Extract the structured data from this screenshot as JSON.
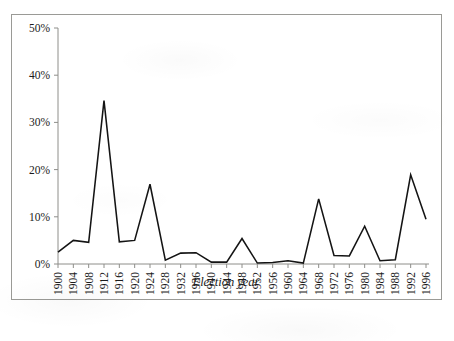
{
  "figure": {
    "axis_title_x": "Election year",
    "axis_title_y": "",
    "border_color": "#9a9a96",
    "line_color": "#141414",
    "background": "#ffffff"
  },
  "chart_data": {
    "type": "line",
    "title": "",
    "subtitle": "",
    "xlabel": "Election year",
    "ylabel": "",
    "grid": false,
    "legend": null,
    "xlim": [
      1900,
      1996
    ],
    "ylim": [
      0,
      50
    ],
    "ytick_labels": [
      "0%",
      "10%",
      "20%",
      "30%",
      "40%",
      "50%"
    ],
    "ytick_values": [
      0,
      10,
      20,
      30,
      40,
      50
    ],
    "categories": [
      "1900",
      "1904",
      "1908",
      "1912",
      "1916",
      "1920",
      "1924",
      "1928",
      "1932",
      "1936",
      "1940",
      "1944",
      "1948",
      "1952",
      "1956",
      "1960",
      "1964",
      "1968",
      "1972",
      "1976",
      "1980",
      "1984",
      "1988",
      "1992",
      "1996"
    ],
    "x": [
      1900,
      1904,
      1908,
      1912,
      1916,
      1920,
      1924,
      1928,
      1932,
      1936,
      1940,
      1944,
      1948,
      1952,
      1956,
      1960,
      1964,
      1968,
      1972,
      1976,
      1980,
      1984,
      1988,
      1992,
      1996
    ],
    "values": [
      2.5,
      5.0,
      4.6,
      34.6,
      4.7,
      5.0,
      16.9,
      0.8,
      2.3,
      2.4,
      0.4,
      0.4,
      5.4,
      0.2,
      0.3,
      0.7,
      0.2,
      13.8,
      1.8,
      1.7,
      8.0,
      0.7,
      0.9,
      18.9,
      9.5
    ],
    "series": [
      {
        "name": "Third-party vote share",
        "values": [
          2.5,
          5.0,
          4.6,
          34.6,
          4.7,
          5.0,
          16.9,
          0.8,
          2.3,
          2.4,
          0.4,
          0.4,
          5.4,
          0.2,
          0.3,
          0.7,
          0.2,
          13.8,
          1.8,
          1.7,
          8.0,
          0.7,
          0.9,
          18.9,
          9.5
        ]
      }
    ]
  }
}
